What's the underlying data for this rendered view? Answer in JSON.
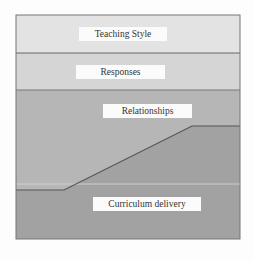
{
  "diagram": {
    "layers": [
      {
        "label": "Teaching Style",
        "fill": "#e2e2e2"
      },
      {
        "label": "Responses",
        "fill": "#d6d6d6"
      },
      {
        "label": "Relationships",
        "fill": "#b4b4b4"
      },
      {
        "label": "Curriculum delivery",
        "fill": "#a3a3a3"
      }
    ],
    "border_color": "#6a6a6a",
    "background": "#fdfdfd"
  }
}
